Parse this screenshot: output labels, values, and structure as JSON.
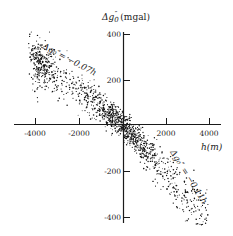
{
  "chart_data": {
    "type": "scatter",
    "title": "",
    "ylabel": "Δg₀″ (mgal)",
    "xlabel": "h(m)",
    "xlim": [
      -4700,
      4500
    ],
    "ylim": [
      -420,
      420
    ],
    "x_ticks": [
      -4000,
      -2000,
      2000,
      4000
    ],
    "x_tick_labels": [
      "-4000",
      "-2000",
      "2000",
      "4000"
    ],
    "y_ticks": [
      400,
      200,
      -200,
      -400
    ],
    "y_tick_labels": [
      "400",
      "200",
      "-200",
      "-400"
    ],
    "grid": false,
    "legend": null,
    "annotations": [
      {
        "text": "Δg₀″= −0.07h",
        "position": "upper-left, along upper branch",
        "slope": -0.07
      },
      {
        "text": "Δg₀″ = −0.11h",
        "position": "lower-right, along lower branch",
        "slope": -0.11
      }
    ],
    "series": [
      {
        "name": "observations",
        "description": "dense point cloud; for h<0 follows roughly -0.07h, for h>0 follows roughly -0.11h",
        "sample_points": [
          {
            "x": -4000,
            "y": 290
          },
          {
            "x": -3800,
            "y": 270
          },
          {
            "x": -3500,
            "y": 250
          },
          {
            "x": -3000,
            "y": 215
          },
          {
            "x": -2500,
            "y": 180
          },
          {
            "x": -2000,
            "y": 140
          },
          {
            "x": -1500,
            "y": 105
          },
          {
            "x": -1000,
            "y": 70
          },
          {
            "x": -500,
            "y": 35
          },
          {
            "x": 0,
            "y": 0
          },
          {
            "x": 500,
            "y": -55
          },
          {
            "x": 1000,
            "y": -110
          },
          {
            "x": 1500,
            "y": -165
          },
          {
            "x": 2000,
            "y": -220
          },
          {
            "x": 2500,
            "y": -275
          },
          {
            "x": 3000,
            "y": -330
          },
          {
            "x": 3500,
            "y": -385
          },
          {
            "x": 3800,
            "y": -415
          }
        ]
      }
    ]
  },
  "axes": {
    "y_title_main": "Δg",
    "y_title_sub": "0",
    "y_title_sup": "″",
    "y_title_unit": "(mgal)",
    "x_title": "h(m)"
  },
  "lines": {
    "upper_label": "Δg₀″= −0.07h",
    "lower_label": "Δg₀″ = −0.11h"
  },
  "scatter_gen": {
    "seed": 12345,
    "count": 1400,
    "color": "#111111"
  },
  "colors": {
    "ink": "#1a1a1a",
    "background": "#ffffff"
  }
}
